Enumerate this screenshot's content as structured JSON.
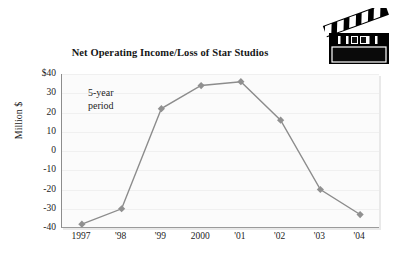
{
  "chart_data": {
    "type": "line",
    "title": "Net Operating Income/Loss of Star Studios",
    "xlabel": "",
    "ylabel": "Million $",
    "categories": [
      "1997",
      "'98",
      "'99",
      "2000",
      "'01",
      "'02",
      "'03",
      "'04"
    ],
    "values": [
      -38,
      -30,
      22,
      34,
      36,
      16,
      -20,
      -33
    ],
    "ylim": [
      -40,
      40
    ],
    "yticks": [
      "$40",
      "30",
      "20",
      "10",
      "0",
      "-10",
      "-20",
      "-30",
      "-40"
    ],
    "ytick_values": [
      40,
      30,
      20,
      10,
      0,
      -10,
      -20,
      -30,
      -40
    ],
    "grid": true,
    "legend": "none",
    "annotations": [
      {
        "line1": "5-year",
        "line2": "period"
      }
    ],
    "series_color": "#8c8c8c",
    "marker": "diamond",
    "marker_color": "#909090"
  },
  "icons": {
    "clapperboard": "clapperboard-icon"
  }
}
